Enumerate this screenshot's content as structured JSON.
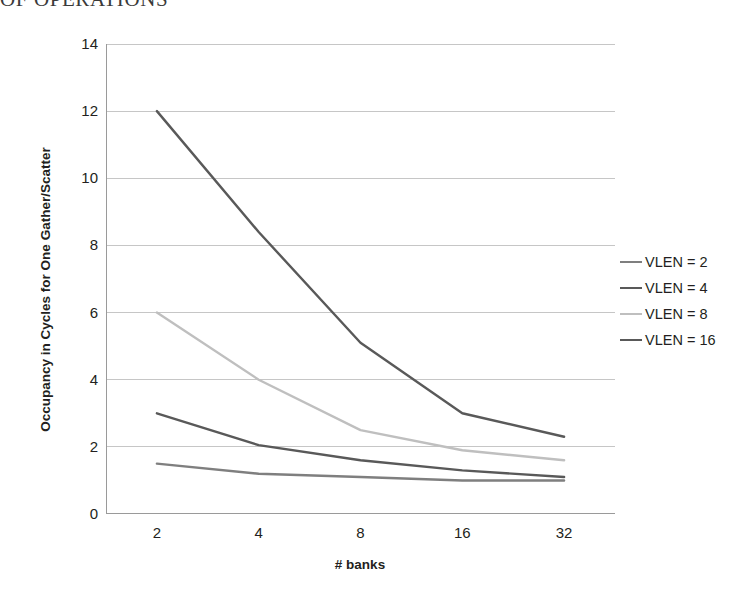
{
  "page": {
    "heading_cropped": "OF OPERATIONS"
  },
  "chart_data": {
    "type": "line",
    "title": "",
    "xlabel": "# banks",
    "ylabel": "Occupancy in Cycles for One Gather/Scatter",
    "categories": [
      "2",
      "4",
      "8",
      "16",
      "32"
    ],
    "ylim": [
      0,
      14
    ],
    "yticks": [
      "0",
      "2",
      "4",
      "6",
      "8",
      "10",
      "12",
      "14"
    ],
    "grid": true,
    "legend_position": "right",
    "series": [
      {
        "name": "VLEN = 2",
        "color": "#7f7f7f",
        "values": [
          1.5,
          1.2,
          1.1,
          1.0,
          1.0
        ]
      },
      {
        "name": "VLEN = 4",
        "color": "#595959",
        "values": [
          3.0,
          2.05,
          1.6,
          1.3,
          1.1
        ]
      },
      {
        "name": "VLEN = 8",
        "color": "#bfbfbf",
        "values": [
          6.0,
          4.0,
          2.5,
          1.9,
          1.6
        ]
      },
      {
        "name": "VLEN = 16",
        "color": "#595959",
        "values": [
          12.0,
          8.4,
          5.1,
          3.0,
          2.3
        ]
      }
    ]
  },
  "legend": {
    "items": [
      {
        "label": "VLEN = 2"
      },
      {
        "label": "VLEN = 4"
      },
      {
        "label": "VLEN = 8"
      },
      {
        "label": "VLEN = 16"
      }
    ]
  },
  "axis": {
    "y_labels": [
      "14",
      "12",
      "10",
      "8",
      "6",
      "4",
      "2",
      "0"
    ],
    "x_labels": [
      "2",
      "4",
      "8",
      "16",
      "32"
    ]
  },
  "colors": {
    "gridline": "#c6c6c6",
    "axis": "#9a9a9a",
    "text": "#231f20",
    "background": "#ffffff"
  }
}
